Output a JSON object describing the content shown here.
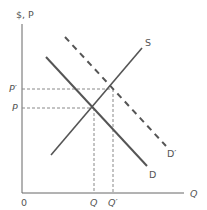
{
  "diagram": {
    "type": "supply-demand",
    "axes": {
      "y_label": "$, P",
      "x_label": "Q",
      "origin_label": "0"
    },
    "curves": {
      "supply_label": "S",
      "demand_label": "D",
      "new_demand_label": "D′"
    },
    "price_labels": {
      "new_price": "P′",
      "price": "P"
    },
    "quantity_labels": {
      "quantity": "Q",
      "new_quantity": "Q′"
    },
    "colors": {
      "line": "#555555",
      "dashed": "#777777"
    }
  }
}
